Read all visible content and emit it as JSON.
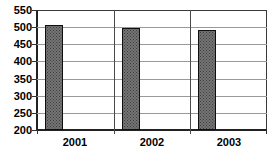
{
  "chart_data": {
    "type": "bar",
    "title": "",
    "xlabel": "",
    "ylabel": "",
    "categories": [
      "2001",
      "2002",
      "2003"
    ],
    "values": [
      505,
      497,
      492
    ],
    "ylim": [
      200,
      550
    ],
    "ytick_step": 50,
    "yticks": [
      550,
      500,
      450,
      400,
      350,
      300,
      250,
      200
    ],
    "grid": true,
    "legend": false,
    "colors": {
      "background": "#ffffff",
      "bar_fill": "#757575",
      "bar_dot_pattern": "#3d3d3d",
      "bar_border": "#0f0f0f",
      "gridline": "#999999",
      "frame": "#3a3a3a",
      "axis": "#222222",
      "text": "#000000"
    }
  }
}
